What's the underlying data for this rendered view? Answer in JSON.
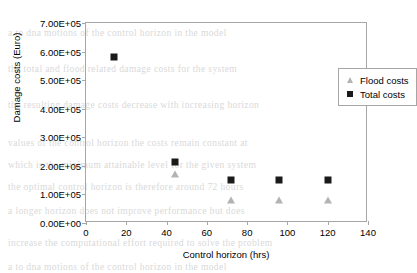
{
  "chart_data": {
    "type": "scatter",
    "title": "",
    "xlabel": "Control horizon (hrs)",
    "ylabel": "Damage costs (Euro)",
    "xlim": [
      0,
      140
    ],
    "ylim": [
      0,
      700000
    ],
    "xticks": [
      "0",
      "20",
      "40",
      "60",
      "80",
      "100",
      "120",
      "140"
    ],
    "xtick_values": [
      0,
      20,
      40,
      60,
      80,
      100,
      120,
      140
    ],
    "yticks": [
      "0.00E+00",
      "1.00E+05",
      "2.00E+05",
      "3.00E+05",
      "4.00E+05",
      "5.00E+05",
      "6.00E+05",
      "7.00E+05"
    ],
    "ytick_values": [
      0,
      100000,
      200000,
      300000,
      400000,
      500000,
      600000,
      700000
    ],
    "grid": false,
    "legend_position": "top-right",
    "series": [
      {
        "name": "Flood costs",
        "marker": "triangle",
        "color": "#b3b3b3",
        "x": [
          44,
          72,
          96,
          120
        ],
        "y": [
          170000,
          80000,
          80000,
          80000
        ]
      },
      {
        "name": "Total costs",
        "marker": "square",
        "color": "#1a1a1a",
        "x": [
          14,
          44,
          72,
          96,
          120
        ],
        "y": [
          580000,
          215000,
          150000,
          150000,
          150000
        ]
      }
    ]
  },
  "background_text": [
    "a  to  dna  motions  of  the  control  horizon  in  the  model",
    "the  total  and  flood  related  damage  costs  for  the  system",
    "the  resulting  damage  costs  decrease  with  increasing  horizon",
    "values  of  the  control  horizon  the  costs  remain  constant  at",
    "which  is  the  minimum  attainable  level  for  the  given  system",
    "the  optimal  control  horizon  is  therefore  around  72  hours",
    "a  longer  horizon  does  not  improve  performance  but  does",
    "increase  the  computational  effort  required  to  solve  the  problem"
  ]
}
